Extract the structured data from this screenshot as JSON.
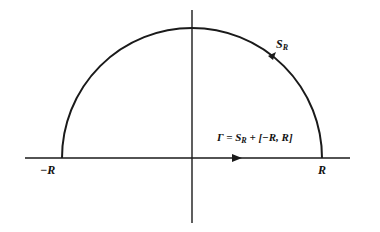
{
  "diagram": {
    "title": "",
    "colors": {
      "stroke": "#1a1a1a",
      "background": "#ffffff"
    },
    "labels": {
      "neg_r": "−R",
      "pos_r": "R",
      "arc_s": "S",
      "arc_sub": "R",
      "gamma": "Γ = S",
      "gamma_sub": "R",
      "gamma_rest": " + [−R, R]"
    },
    "elements": {
      "axes": {
        "x_range": [
          25,
          350
        ],
        "y_axis_x": 192,
        "y_range": [
          10,
          223
        ],
        "x_axis_y": 158
      },
      "semicircle": {
        "center": [
          192,
          158
        ],
        "radius": 130,
        "orientation": "counterclockwise"
      },
      "arrows": [
        "on arc near S_R pointing up-left",
        "on x-axis pointing right"
      ]
    }
  }
}
